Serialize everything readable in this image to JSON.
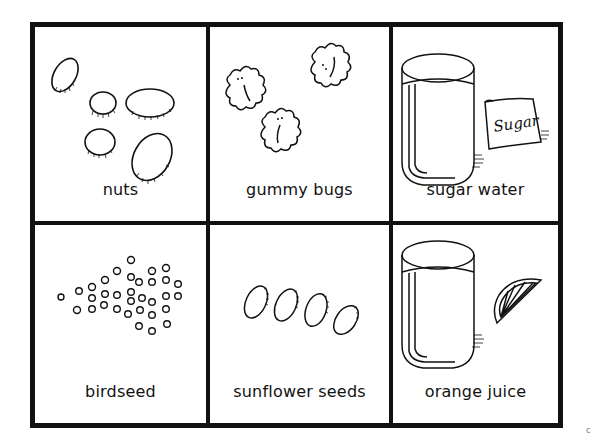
{
  "card_grid": {
    "rows": 2,
    "columns": 3,
    "cards": [
      {
        "label": "nuts",
        "icon": "nuts-icon"
      },
      {
        "label": "gummy bugs",
        "icon": "gummy-bugs-icon"
      },
      {
        "label": "sugar water",
        "icon": "sugar-water-icon",
        "bag_text": "Sugar"
      },
      {
        "label": "birdseed",
        "icon": "birdseed-icon"
      },
      {
        "label": "sunflower seeds",
        "icon": "sunflower-seeds-icon"
      },
      {
        "label": "orange juice",
        "icon": "orange-juice-icon"
      }
    ],
    "colors": {
      "line": "#111111",
      "background": "#ffffff"
    }
  },
  "corner_mark": "c"
}
